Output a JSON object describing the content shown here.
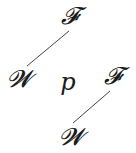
{
  "diagram": {
    "nodes": [
      {
        "id": "top",
        "label": "𝓕",
        "x": 70,
        "y": 16
      },
      {
        "id": "left",
        "label": "𝓦",
        "x": 19,
        "y": 79
      },
      {
        "id": "center",
        "label": "p",
        "x": 68,
        "y": 82
      },
      {
        "id": "right",
        "label": "𝓕",
        "x": 113,
        "y": 76
      },
      {
        "id": "bottom",
        "label": "𝓦",
        "x": 71,
        "y": 137
      }
    ],
    "edges": [
      {
        "from": "top",
        "to": "left",
        "x1": 69,
        "y1": 31,
        "x2": 27,
        "y2": 66
      },
      {
        "from": "right",
        "to": "bottom",
        "x1": 110,
        "y1": 91,
        "x2": 73,
        "y2": 123
      }
    ],
    "line_color": "#444444"
  }
}
